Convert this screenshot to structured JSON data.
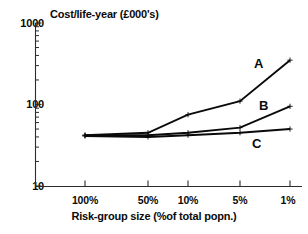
{
  "chart_data": {
    "type": "line",
    "title": "Cost/life-year (£000's)",
    "xlabel": "Risk-group size (%of total popn.)",
    "ylabel": "",
    "categories": [
      "100%",
      "50%",
      "10%",
      "5%",
      "1%"
    ],
    "yscale": "log",
    "ylim": [
      10,
      1000
    ],
    "ytick_labels": [
      "1000",
      "100",
      "10"
    ],
    "ytick_values": [
      1000,
      100,
      10
    ],
    "grid": false,
    "legend_position": "inline-right",
    "series": [
      {
        "name": "A",
        "values": [
          42,
          45,
          75,
          110,
          350
        ]
      },
      {
        "name": "B",
        "values": [
          42,
          42,
          45,
          52,
          95
        ]
      },
      {
        "name": "C",
        "values": [
          41,
          40,
          42,
          45,
          50
        ]
      }
    ],
    "annotations": [
      {
        "text": "A",
        "series": "A"
      },
      {
        "text": "B",
        "series": "B"
      },
      {
        "text": "C",
        "series": "C"
      }
    ]
  },
  "axes": {
    "y": {
      "ticks": [
        {
          "label": "1000"
        },
        {
          "label": "100"
        },
        {
          "label": "10"
        }
      ]
    },
    "x": {
      "ticks": [
        {
          "label": "100%"
        },
        {
          "label": "50%"
        },
        {
          "label": "10%"
        },
        {
          "label": "5%"
        },
        {
          "label": "1%"
        }
      ]
    }
  },
  "labels": {
    "series_a": "A",
    "series_b": "B",
    "series_c": "C"
  },
  "colors": {
    "line": "#0a0a0a",
    "axis": "#2b2b2b",
    "text": "#0a0a0a",
    "background": "#ffffff"
  }
}
